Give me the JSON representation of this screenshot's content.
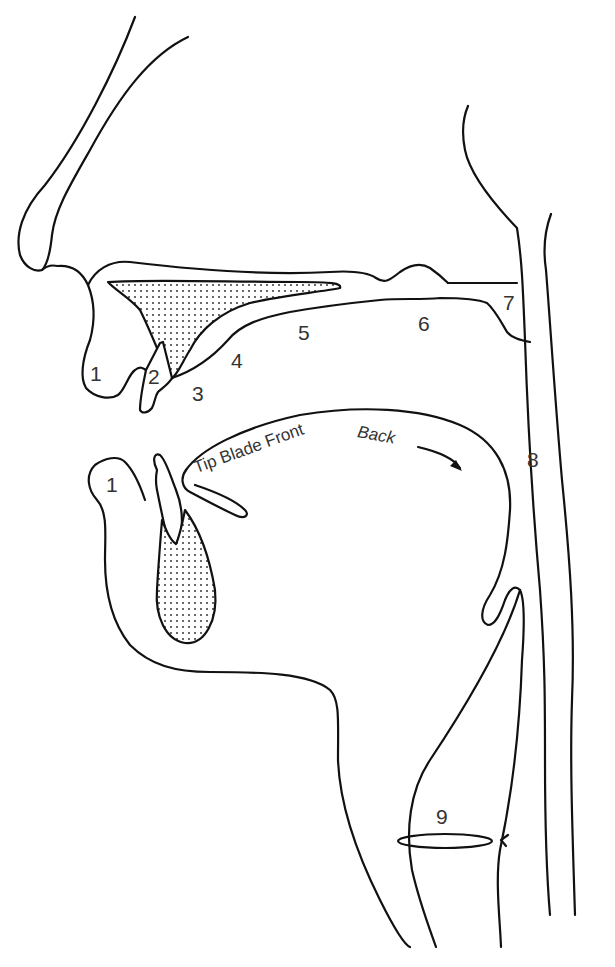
{
  "diagram": {
    "stroke_color": "#111111",
    "label_color": "#333333",
    "labels": {
      "upper_lip": "1",
      "upper_teeth": "2",
      "alveolar_ridge": "3",
      "post_alveolar": "4",
      "hard_palate": "5",
      "soft_palate": "6",
      "uvula": "7",
      "pharynx": "8",
      "glottis": "9",
      "lower_lip": "1"
    },
    "tongue_parts": {
      "tip_blade_front": "Tip Blade Front",
      "back": "Back"
    }
  }
}
